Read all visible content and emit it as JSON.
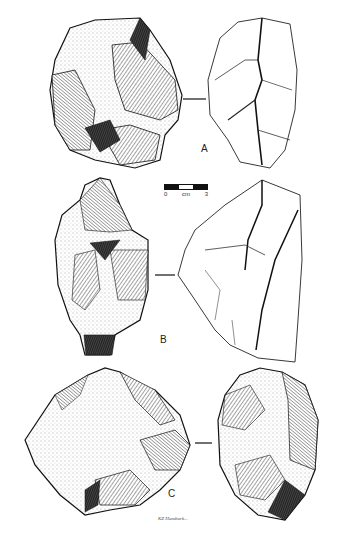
{
  "figure": {
    "type": "archaeological-artifact-plate",
    "background": "#ffffff",
    "ink_color": "#1a1a1a"
  },
  "artifacts": [
    {
      "id": "A",
      "label": "A",
      "views": [
        "dorsal-stippled",
        "profile-outline"
      ]
    },
    {
      "id": "B",
      "label": "B",
      "views": [
        "dorsal-stippled",
        "profile-outline"
      ]
    },
    {
      "id": "C",
      "label": "C",
      "views": [
        "dorsal-stippled",
        "profile-stippled"
      ]
    }
  ],
  "scale_bar": {
    "start": "0",
    "unit": "cm",
    "end": "3"
  },
  "signature": "KZ Hamburk..."
}
